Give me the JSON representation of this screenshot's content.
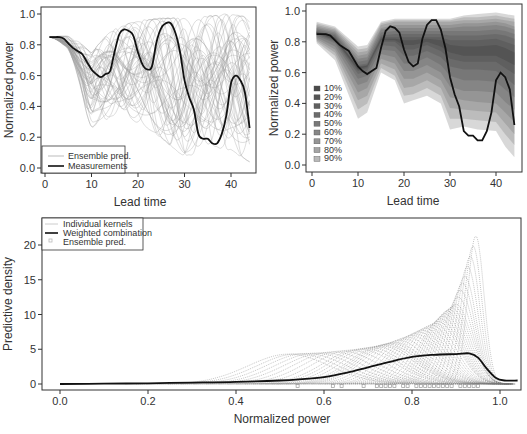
{
  "chart_data": [
    {
      "id": "ensemble-trajectories",
      "type": "line",
      "title": "",
      "xlabel": "Lead time",
      "ylabel": "Normalized power",
      "xlim": [
        0,
        44
      ],
      "ylim": [
        0,
        1.0
      ],
      "xticks": [
        0,
        10,
        20,
        30,
        40
      ],
      "yticks": [
        0.0,
        0.2,
        0.4,
        0.6,
        0.8,
        1.0
      ],
      "xtick_labels": [
        "0",
        "10",
        "20",
        "30",
        "40"
      ],
      "ytick_labels": [
        "0.0",
        "0.2",
        "0.4",
        "0.6",
        "0.8",
        "1.0"
      ],
      "grid": false,
      "legend_position": "bottom-left",
      "legend": [
        {
          "label": "Ensemble pred.",
          "style": "thin-grey-line"
        },
        {
          "label": "Measurements",
          "style": "thick-black-line"
        }
      ],
      "series": [
        {
          "name": "Measurements",
          "x": [
            1,
            2,
            3,
            4,
            5,
            6,
            7,
            8,
            9,
            10,
            11,
            12,
            13,
            14,
            15,
            16,
            17,
            18,
            19,
            20,
            21,
            22,
            23,
            24,
            25,
            26,
            27,
            28,
            29,
            30,
            31,
            32,
            33,
            34,
            35,
            36,
            37,
            38,
            39,
            40,
            41,
            42,
            43,
            44
          ],
          "values": [
            0.85,
            0.85,
            0.85,
            0.84,
            0.81,
            0.78,
            0.76,
            0.74,
            0.69,
            0.64,
            0.61,
            0.59,
            0.61,
            0.63,
            0.76,
            0.87,
            0.9,
            0.89,
            0.86,
            0.75,
            0.67,
            0.64,
            0.66,
            0.82,
            0.91,
            0.94,
            0.94,
            0.88,
            0.76,
            0.57,
            0.46,
            0.38,
            0.22,
            0.19,
            0.19,
            0.16,
            0.16,
            0.22,
            0.34,
            0.55,
            0.6,
            0.57,
            0.49,
            0.26
          ]
        },
        {
          "name": "Ensemble pred.",
          "description": "~50 thin grey ensemble member trajectories spanning roughly 0.05 to 1.0",
          "envelope_x": [
            1,
            5,
            10,
            15,
            20,
            25,
            30,
            35,
            40,
            44
          ],
          "envelope_low": [
            0.8,
            0.68,
            0.27,
            0.35,
            0.3,
            0.2,
            0.07,
            0.15,
            0.12,
            0.04
          ],
          "envelope_high": [
            0.88,
            0.86,
            0.75,
            0.92,
            0.95,
            0.97,
            0.97,
            0.98,
            1.0,
            0.97
          ]
        }
      ]
    },
    {
      "id": "quantile-fan",
      "type": "area",
      "title": "",
      "xlabel": "Lead time",
      "ylabel": "Normalized power",
      "xlim": [
        0,
        44
      ],
      "ylim": [
        0,
        1.0
      ],
      "xticks": [
        0,
        10,
        20,
        30,
        40
      ],
      "yticks": [
        0.0,
        0.2,
        0.4,
        0.6,
        0.8,
        1.0
      ],
      "xtick_labels": [
        "0",
        "10",
        "20",
        "30",
        "40"
      ],
      "ytick_labels": [
        "0.0",
        "0.2",
        "0.4",
        "0.6",
        "0.8",
        "1.0"
      ],
      "grid": false,
      "legend_position": "bottom-left",
      "legend": [
        {
          "label": "10%",
          "color": "#4a4a4a"
        },
        {
          "label": "20%",
          "color": "#555555"
        },
        {
          "label": "30%",
          "color": "#606060"
        },
        {
          "label": "40%",
          "color": "#6c6c6c"
        },
        {
          "label": "50%",
          "color": "#787878"
        },
        {
          "label": "60%",
          "color": "#868686"
        },
        {
          "label": "70%",
          "color": "#959595"
        },
        {
          "label": "80%",
          "color": "#a5a5a5"
        },
        {
          "label": "90%",
          "color": "#b8b8b8"
        }
      ],
      "x": [
        1,
        5,
        10,
        12,
        15,
        18,
        20,
        22,
        25,
        28,
        30,
        33,
        36,
        40,
        42,
        44
      ],
      "bands": [
        {
          "level": "90%",
          "low": [
            0.79,
            0.68,
            0.3,
            0.34,
            0.6,
            0.55,
            0.4,
            0.42,
            0.45,
            0.4,
            0.23,
            0.25,
            0.23,
            0.22,
            0.12,
            0.05
          ],
          "high": [
            0.93,
            0.9,
            0.77,
            0.78,
            0.93,
            0.95,
            0.95,
            0.95,
            0.95,
            0.95,
            0.95,
            0.97,
            0.98,
            0.99,
            0.98,
            0.97
          ]
        },
        {
          "level": "80%",
          "low": [
            0.8,
            0.71,
            0.36,
            0.4,
            0.63,
            0.58,
            0.45,
            0.46,
            0.5,
            0.45,
            0.3,
            0.3,
            0.29,
            0.28,
            0.2,
            0.13
          ],
          "high": [
            0.92,
            0.89,
            0.75,
            0.76,
            0.92,
            0.94,
            0.94,
            0.94,
            0.94,
            0.94,
            0.94,
            0.96,
            0.96,
            0.97,
            0.96,
            0.95
          ]
        },
        {
          "level": "70%",
          "low": [
            0.81,
            0.73,
            0.42,
            0.45,
            0.66,
            0.62,
            0.5,
            0.51,
            0.55,
            0.5,
            0.37,
            0.36,
            0.35,
            0.34,
            0.27,
            0.2
          ],
          "high": [
            0.91,
            0.88,
            0.73,
            0.74,
            0.91,
            0.93,
            0.93,
            0.93,
            0.93,
            0.93,
            0.93,
            0.94,
            0.94,
            0.95,
            0.94,
            0.93
          ]
        },
        {
          "level": "60%",
          "low": [
            0.82,
            0.75,
            0.47,
            0.5,
            0.69,
            0.66,
            0.56,
            0.56,
            0.6,
            0.55,
            0.44,
            0.42,
            0.41,
            0.4,
            0.34,
            0.28
          ],
          "high": [
            0.9,
            0.87,
            0.71,
            0.72,
            0.89,
            0.91,
            0.91,
            0.91,
            0.91,
            0.91,
            0.91,
            0.92,
            0.92,
            0.93,
            0.92,
            0.9
          ]
        },
        {
          "level": "50%",
          "low": [
            0.83,
            0.77,
            0.52,
            0.54,
            0.72,
            0.7,
            0.61,
            0.61,
            0.65,
            0.6,
            0.51,
            0.48,
            0.48,
            0.47,
            0.41,
            0.36
          ],
          "high": [
            0.89,
            0.86,
            0.69,
            0.7,
            0.88,
            0.89,
            0.89,
            0.89,
            0.89,
            0.89,
            0.89,
            0.9,
            0.9,
            0.91,
            0.9,
            0.88
          ]
        },
        {
          "level": "40%",
          "low": [
            0.84,
            0.79,
            0.56,
            0.58,
            0.75,
            0.74,
            0.66,
            0.66,
            0.7,
            0.65,
            0.58,
            0.55,
            0.55,
            0.54,
            0.49,
            0.44
          ],
          "high": [
            0.88,
            0.85,
            0.67,
            0.68,
            0.86,
            0.87,
            0.87,
            0.87,
            0.87,
            0.87,
            0.87,
            0.87,
            0.87,
            0.88,
            0.87,
            0.85
          ]
        },
        {
          "level": "30%",
          "low": [
            0.85,
            0.8,
            0.59,
            0.61,
            0.78,
            0.77,
            0.71,
            0.71,
            0.74,
            0.7,
            0.64,
            0.62,
            0.62,
            0.61,
            0.57,
            0.52
          ],
          "high": [
            0.87,
            0.84,
            0.65,
            0.66,
            0.84,
            0.85,
            0.85,
            0.85,
            0.85,
            0.85,
            0.84,
            0.84,
            0.84,
            0.85,
            0.84,
            0.82
          ]
        },
        {
          "level": "20%",
          "low": [
            0.855,
            0.81,
            0.61,
            0.63,
            0.8,
            0.8,
            0.75,
            0.75,
            0.78,
            0.74,
            0.69,
            0.67,
            0.67,
            0.67,
            0.63,
            0.59
          ],
          "high": [
            0.865,
            0.83,
            0.64,
            0.65,
            0.83,
            0.83,
            0.83,
            0.83,
            0.83,
            0.83,
            0.81,
            0.81,
            0.81,
            0.82,
            0.8,
            0.78
          ]
        },
        {
          "level": "10%",
          "low": [
            0.857,
            0.815,
            0.62,
            0.64,
            0.81,
            0.81,
            0.78,
            0.78,
            0.8,
            0.77,
            0.73,
            0.71,
            0.71,
            0.71,
            0.68,
            0.65
          ],
          "high": [
            0.862,
            0.825,
            0.635,
            0.645,
            0.82,
            0.82,
            0.81,
            0.81,
            0.82,
            0.81,
            0.78,
            0.77,
            0.77,
            0.78,
            0.76,
            0.73
          ]
        }
      ],
      "series": [
        {
          "name": "Measurements",
          "x": [
            1,
            2,
            3,
            4,
            5,
            6,
            7,
            8,
            9,
            10,
            11,
            12,
            13,
            14,
            15,
            16,
            17,
            18,
            19,
            20,
            21,
            22,
            23,
            24,
            25,
            26,
            27,
            28,
            29,
            30,
            31,
            32,
            33,
            34,
            35,
            36,
            37,
            38,
            39,
            40,
            41,
            42,
            43,
            44
          ],
          "values": [
            0.85,
            0.85,
            0.85,
            0.84,
            0.81,
            0.78,
            0.76,
            0.74,
            0.69,
            0.64,
            0.61,
            0.59,
            0.61,
            0.63,
            0.76,
            0.87,
            0.9,
            0.89,
            0.86,
            0.75,
            0.67,
            0.64,
            0.66,
            0.82,
            0.91,
            0.94,
            0.94,
            0.88,
            0.76,
            0.57,
            0.46,
            0.38,
            0.22,
            0.19,
            0.19,
            0.16,
            0.16,
            0.22,
            0.34,
            0.55,
            0.6,
            0.57,
            0.49,
            0.26
          ]
        }
      ]
    },
    {
      "id": "predictive-density",
      "type": "line",
      "title": "",
      "xlabel": "Normalized power",
      "ylabel": "Predictive density",
      "xlim": [
        -0.03,
        1.04
      ],
      "ylim": [
        -0.5,
        22
      ],
      "xticks": [
        0.0,
        0.2,
        0.4,
        0.6,
        0.8,
        1.0
      ],
      "yticks": [
        0,
        5,
        10,
        15,
        20
      ],
      "xtick_labels": [
        "0.0",
        "0.2",
        "0.4",
        "0.6",
        "0.8",
        "1.0"
      ],
      "ytick_labels": [
        "0",
        "5",
        "10",
        "15",
        "20"
      ],
      "grid": false,
      "legend_position": "top-left",
      "legend": [
        {
          "label": "Individual kernels",
          "style": "thin-grey-dotted-line"
        },
        {
          "label": "Weighted combination",
          "style": "thick-black-line"
        },
        {
          "label": "Ensemble pred.",
          "style": "grey-square-marker"
        }
      ],
      "series": [
        {
          "name": "Weighted combination",
          "x": [
            0.0,
            0.1,
            0.2,
            0.3,
            0.4,
            0.5,
            0.55,
            0.6,
            0.65,
            0.7,
            0.75,
            0.8,
            0.85,
            0.9,
            0.93,
            0.95,
            0.97,
            0.99,
            1.01,
            1.04
          ],
          "values": [
            0.0,
            0.05,
            0.1,
            0.2,
            0.3,
            0.5,
            0.7,
            1.0,
            1.6,
            2.4,
            3.2,
            3.9,
            4.2,
            4.3,
            4.4,
            3.8,
            2.2,
            0.9,
            0.5,
            0.5
          ]
        },
        {
          "name": "Individual kernels",
          "description": "many thin dotted grey kernel densities; peaks rise toward right",
          "peaks": [
            {
              "center": 0.52,
              "height": 4.3
            },
            {
              "center": 0.6,
              "height": 4.5
            },
            {
              "center": 0.68,
              "height": 5.0
            },
            {
              "center": 0.73,
              "height": 5.5
            },
            {
              "center": 0.76,
              "height": 6.0
            },
            {
              "center": 0.8,
              "height": 7.0
            },
            {
              "center": 0.83,
              "height": 8.0
            },
            {
              "center": 0.86,
              "height": 9.0
            },
            {
              "center": 0.88,
              "height": 10.5
            },
            {
              "center": 0.9,
              "height": 11.5
            },
            {
              "center": 0.92,
              "height": 15.5
            },
            {
              "center": 0.945,
              "height": 21.3
            }
          ]
        },
        {
          "name": "Ensemble pred.",
          "marker": "square",
          "y": 0,
          "x": [
            0.54,
            0.62,
            0.64,
            0.69,
            0.72,
            0.73,
            0.74,
            0.75,
            0.76,
            0.78,
            0.79,
            0.81,
            0.82,
            0.83,
            0.84,
            0.85,
            0.86,
            0.87,
            0.88,
            0.89,
            0.91,
            0.92,
            0.93,
            0.94,
            0.95
          ]
        }
      ]
    }
  ]
}
